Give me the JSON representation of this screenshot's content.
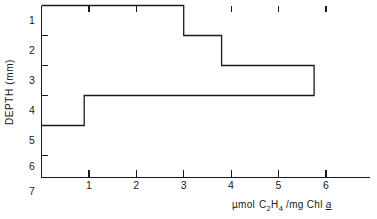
{
  "chart_data": {
    "type": "bar",
    "orientation": "horizontal-step",
    "title": "",
    "xlabel": "µmol C2H4 /mg Chl a",
    "ylabel": "DEPTH (mm)",
    "xlim": [
      0,
      6.93
    ],
    "ylim": [
      0.5,
      7.5
    ],
    "grid": false,
    "legend": null,
    "xticks": [
      1,
      2,
      3,
      4,
      5,
      6
    ],
    "xticklabels": [
      "1",
      "2",
      "3",
      "4",
      "5",
      "6"
    ],
    "yticks": [
      1,
      2,
      3,
      4,
      5,
      6,
      7
    ],
    "yticklabels": [
      "1",
      "2",
      "3",
      "4",
      "5",
      "6",
      "7"
    ],
    "depth_bands": [
      {
        "label": "1",
        "top": 0.5,
        "bottom": 1.5,
        "value": 3.0
      },
      {
        "label": "2",
        "top": 1.5,
        "bottom": 2.5,
        "value": 3.8
      },
      {
        "label": "3",
        "top": 2.5,
        "bottom": 3.5,
        "value": 5.75
      },
      {
        "label": "4",
        "top": 3.5,
        "bottom": 4.5,
        "value": 0.9
      },
      {
        "label": "5",
        "top": 4.5,
        "bottom": 5.5,
        "value": 0.0
      },
      {
        "label": "6",
        "top": 5.5,
        "bottom": 6.5,
        "value": 0.0
      },
      {
        "label": "7",
        "top": 6.5,
        "bottom": 7.5,
        "value": 0.0
      }
    ],
    "categories": [
      "1",
      "2",
      "3",
      "4",
      "5",
      "6",
      "7"
    ],
    "values": [
      3.0,
      3.8,
      5.75,
      0.9,
      0.0,
      0.0,
      0.0
    ]
  },
  "xlabel_parts": {
    "umol": "µmol",
    "c": "C",
    "c_sub": "2",
    "h": "H",
    "h_sub": "4",
    "mg_chl": "/mg Chl",
    "species": "a"
  },
  "axes": {
    "y_title": "DEPTH (mm)"
  }
}
